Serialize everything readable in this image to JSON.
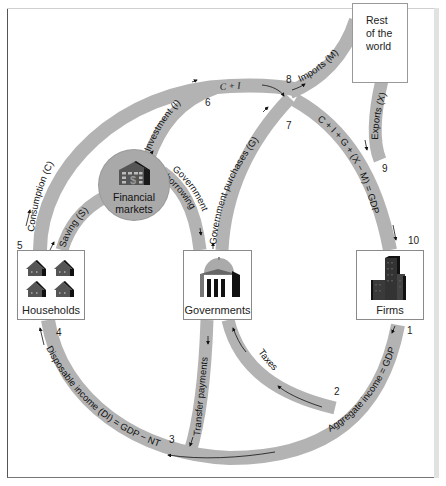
{
  "diagram": {
    "type": "circular-flow-of-income",
    "nodes": {
      "households": {
        "label": "Households"
      },
      "governments": {
        "label": "Governments"
      },
      "firms": {
        "label": "Firms"
      },
      "financial_markets": {
        "label_line1": "Financial",
        "label_line2": "markets"
      },
      "rest_of_world": {
        "label_line1": "Rest",
        "label_line2": "of the",
        "label_line3": "world"
      }
    },
    "flows": {
      "aggregate_income": "Aggregate income = GDP",
      "taxes": "Taxes",
      "transfer_payments": "Transfer payments",
      "disposable_income": "Disposable income (DI) = GDP − NT",
      "consumption": "Consumption (C)",
      "saving": "Saving (S)",
      "investment": "Investment (I)",
      "government_borrowing_1": "Government",
      "government_borrowing_2": "borrowing",
      "government_purchases": "Government purchases (G)",
      "c_plus_i": "C + I",
      "imports": "Imports (M)",
      "exports": "Exports (X)",
      "gdp_identity": "C + I + G + (X − M) = GDP"
    },
    "numbers": [
      "1",
      "2",
      "3",
      "4",
      "5",
      "6",
      "7",
      "8",
      "9",
      "10"
    ],
    "colors": {
      "flow_band": "#b3b3b3",
      "circle": "#a9a9a9",
      "box_border": "#8a8a8a",
      "text": "#222222"
    }
  }
}
